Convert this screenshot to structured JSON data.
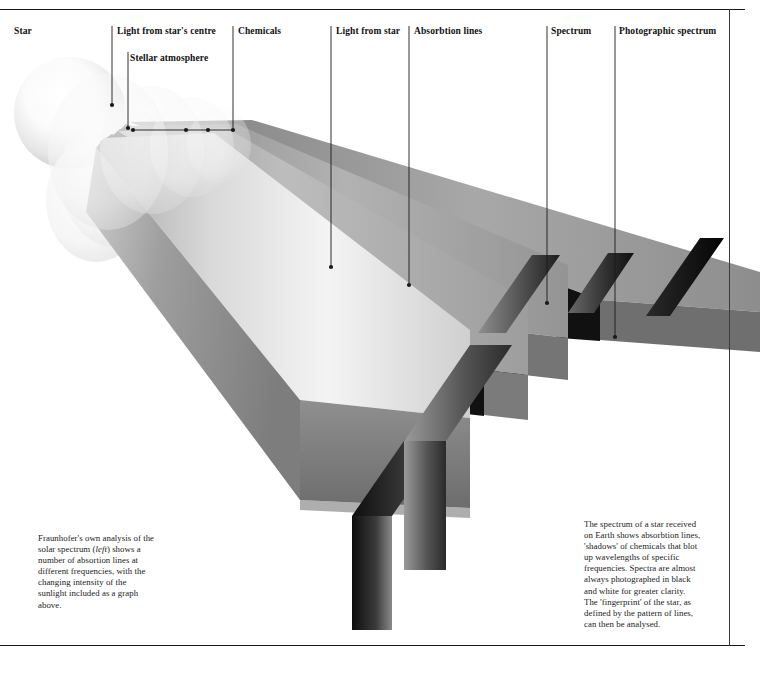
{
  "page": {
    "background": "#ffffff",
    "ink": "#111111",
    "width": 760,
    "height": 680
  },
  "labels": [
    {
      "id": "star",
      "text": "Star",
      "x": 14,
      "y": 31
    },
    {
      "id": "light-from-centre",
      "text": "Light from star's centre",
      "x": 117,
      "y": 31
    },
    {
      "id": "stellar-atmosphere",
      "text": "Stellar atmosphere",
      "x": 130,
      "y": 58
    },
    {
      "id": "chemicals",
      "text": "Chemicals",
      "x": 238,
      "y": 31
    },
    {
      "id": "light-from-star",
      "text": "Light from star",
      "x": 336,
      "y": 31
    },
    {
      "id": "absorbtion-lines",
      "text": "Absorbtion lines",
      "x": 414,
      "y": 31
    },
    {
      "id": "spectrum",
      "text": "Spectrum",
      "x": 551,
      "y": 31
    },
    {
      "id": "photographic-spectrum",
      "text": "Photographic spectrum",
      "x": 619,
      "y": 31
    }
  ],
  "leaders": [
    {
      "id": "leader-light-from-centre",
      "x1": 112,
      "y1": 26,
      "x2": 112,
      "y2": 105,
      "dot": [
        112,
        105
      ]
    },
    {
      "id": "leader-stellar-atmosphere",
      "x1": 128,
      "y1": 52,
      "x2": 128,
      "y2": 128,
      "dot": [
        128,
        128
      ]
    },
    {
      "id": "leader-chemicals",
      "x1": 233,
      "y1": 26,
      "x2": 233,
      "y2": 130,
      "dot": [
        233,
        130
      ]
    },
    {
      "id": "leader-light-from-star",
      "x1": 331,
      "y1": 26,
      "x2": 331,
      "y2": 267,
      "dot": [
        331,
        267
      ]
    },
    {
      "id": "leader-absorbtion-lines",
      "x1": 409,
      "y1": 26,
      "x2": 409,
      "y2": 285,
      "dot": [
        409,
        285
      ]
    },
    {
      "id": "leader-spectrum",
      "x1": 547,
      "y1": 26,
      "x2": 547,
      "y2": 303,
      "dot": [
        547,
        303
      ]
    },
    {
      "id": "leader-photographic",
      "x1": 615,
      "y1": 26,
      "x2": 615,
      "y2": 337,
      "dot": [
        615,
        337
      ]
    }
  ],
  "chemicals_bar": {
    "id": "chemicals-connector",
    "y": 130,
    "x_start": 133,
    "x_end": 233,
    "dots": [
      133,
      186,
      208,
      233
    ]
  },
  "captions": {
    "left": {
      "x": 38,
      "y": 533,
      "width": 150,
      "lines": [
        "Fraunhofer's own analysis of the",
        "solar spectrum (left) shows a",
        "number of absortion lines at",
        "different frequencies, with the",
        "changing intensity of the",
        "sunlight included as a graph",
        "above."
      ],
      "italic_word": "left"
    },
    "right": {
      "x": 584,
      "y": 519,
      "width": 142,
      "lines": [
        "The spectrum of a star received",
        "on Earth shows absorbtion lines,",
        "'shadows' of chemicals that blot",
        "up wavelengths of specific",
        "frequencies. Spectra are almost",
        "always photographed in black",
        "and white for greater clarity.",
        "The 'fingerprint' of the star, as",
        "defined by the pattern of lines,",
        "can then be analysed."
      ]
    }
  },
  "artwork": {
    "star": {
      "cx": 70,
      "cy": 113,
      "r": 56,
      "highlight": "#ffffff",
      "edge": "#d9d9d9"
    },
    "shells": [
      {
        "cx": 104,
        "cy": 150,
        "rx": 62,
        "ry": 80,
        "opacity": 0.55
      },
      {
        "cx": 150,
        "cy": 150,
        "rx": 54,
        "ry": 66,
        "opacity": 0.45
      },
      {
        "cx": 190,
        "cy": 148,
        "rx": 44,
        "ry": 52,
        "opacity": 0.4
      },
      {
        "cx": 218,
        "cy": 146,
        "rx": 34,
        "ry": 40,
        "opacity": 0.35
      }
    ],
    "beam": {
      "description": "Wedge-shaped light beam expanding from star to lower right, split into four slabs by dark absorption gaps",
      "top_face_light": "#f2f2f2",
      "top_face_dark": "#9a9a9a",
      "front_face_light": "#bdbdbd",
      "front_face_dark": "#6e6e6e",
      "side_face": "#8c8c8c",
      "gap_color": "#111111"
    },
    "photographic_spectrum": {
      "description": "Tilted parallelogram photographic plate with dark gradient bands separated by white absorption gaps",
      "band_dark": "#141414",
      "band_mid": "#6a6a6a",
      "gap_color": "#ffffff",
      "band_count": 5
    }
  }
}
